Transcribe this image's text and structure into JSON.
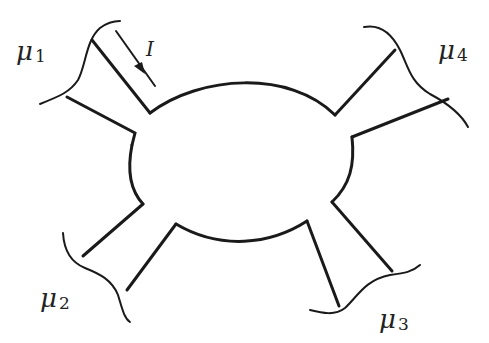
{
  "diagram": {
    "type": "four-terminal conductor",
    "colors": {
      "stroke": "#1a1a1a",
      "background": "#ffffff"
    },
    "current": {
      "symbol": "I",
      "direction": "into device from terminal 1"
    },
    "reservoirs": [
      {
        "id": 1,
        "symbol": "μ",
        "subscript": "1",
        "position": "top-left"
      },
      {
        "id": 2,
        "symbol": "μ",
        "subscript": "2",
        "position": "bottom-left"
      },
      {
        "id": 3,
        "symbol": "μ",
        "subscript": "3",
        "position": "bottom-right"
      },
      {
        "id": 4,
        "symbol": "μ",
        "subscript": "4",
        "position": "top-right"
      }
    ]
  }
}
